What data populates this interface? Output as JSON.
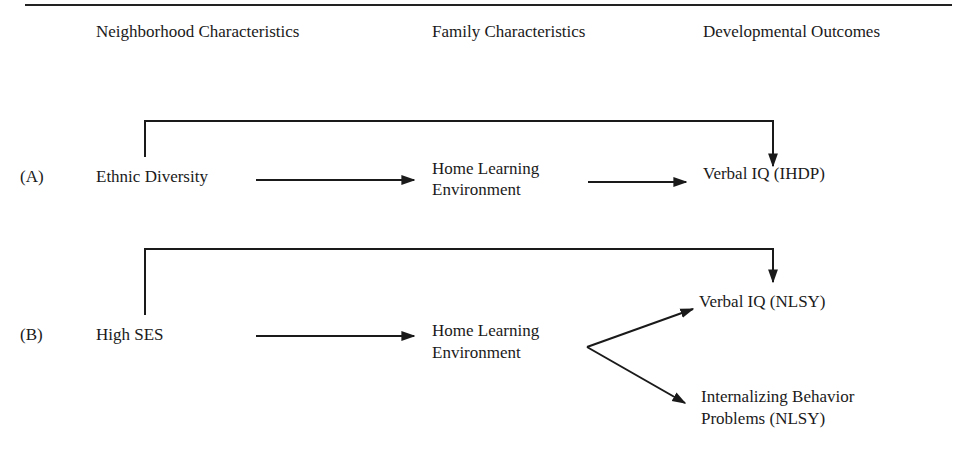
{
  "headers": {
    "neighborhood": "Neighborhood Characteristics",
    "family": "Family Characteristics",
    "outcomes": "Developmental Outcomes"
  },
  "model_a": {
    "label": "(A)",
    "predictor": "Ethnic Diversity",
    "mediator_line1": "Home Learning",
    "mediator_line2": "Environment",
    "outcome": "Verbal IQ (IHDP)"
  },
  "model_b": {
    "label": "(B)",
    "predictor": "High SES",
    "mediator_line1": "Home Learning",
    "mediator_line2": "Environment",
    "outcome1": "Verbal IQ (NLSY)",
    "outcome2_line1": "Internalizing Behavior",
    "outcome2_line2": "Problems (NLSY)"
  },
  "colors": {
    "line": "#1a1a1a",
    "text": "#1a1a1a",
    "background": "#ffffff"
  }
}
